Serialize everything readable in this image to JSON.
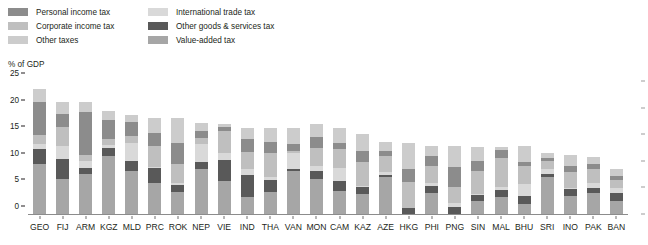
{
  "chart_data": {
    "type": "bar",
    "stacked": true,
    "title": "",
    "subtitle": "",
    "xlabel": "",
    "ylabel": "% of GDP",
    "ylim": [
      0,
      25
    ],
    "yticks": [
      0,
      5,
      10,
      15,
      20,
      25
    ],
    "ytick_labels": [
      "0",
      "5",
      "10",
      "15",
      "20",
      "25"
    ],
    "grid": false,
    "legend_position": "top-left",
    "categories": [
      "GEO",
      "FIJ",
      "ARM",
      "KGZ",
      "MLD",
      "PRC",
      "ROK",
      "NEP",
      "VIE",
      "IND",
      "THA",
      "VAN",
      "MON",
      "CAM",
      "KAZ",
      "AZE",
      "HKG",
      "PHI",
      "PNG",
      "SIN",
      "MAL",
      "BHU",
      "SRI",
      "INO",
      "PAK",
      "BAN"
    ],
    "series": [
      {
        "name": "Value-added tax",
        "color": "#a6a6a6",
        "values": [
          9.6,
          6.8,
          7.8,
          11.0,
          8.3,
          6.1,
          4.3,
          8.6,
          6.4,
          3.3,
          4.3,
          8.2,
          6.7,
          4.6,
          3.9,
          7.1,
          0.0,
          4.1,
          0.0,
          2.7,
          3.3,
          2.1,
          7.2,
          3.6,
          4.2,
          2.6
        ]
      },
      {
        "name": "Other goods & services tax",
        "color": "#595959",
        "values": [
          2.8,
          3.7,
          1.1,
          1.6,
          1.8,
          2.7,
          1.4,
          1.4,
          3.9,
          4.3,
          2.3,
          0.5,
          1.5,
          1.8,
          1.3,
          0.5,
          1.3,
          1.4,
          1.6,
          1.1,
          1.4,
          1.5,
          0.6,
          1.2,
          0.8,
          1.6
        ]
      },
      {
        "name": "International trade tax",
        "color": "#d9d9d9",
        "values": [
          0.9,
          2.4,
          1.2,
          0.6,
          3.4,
          0.3,
          0.4,
          3.3,
          1.3,
          1.0,
          0.5,
          3.0,
          1.1,
          2.5,
          0.3,
          0.4,
          0.0,
          0.5,
          0.6,
          0.2,
          0.6,
          2.2,
          0.9,
          0.3,
          1.0,
          0.9
        ]
      },
      {
        "name": "Corporate income tax",
        "color": "#bfbfbf",
        "values": [
          1.8,
          3.6,
          1.1,
          1.1,
          1.4,
          3.9,
          3.4,
          1.2,
          4.2,
          3.3,
          4.6,
          0.3,
          3.3,
          3.6,
          4.4,
          3.1,
          4.9,
          3.2,
          3.1,
          4.2,
          5.4,
          3.4,
          1.5,
          2.9,
          2.6,
          1.4
        ]
      },
      {
        "name": "Personal income tax",
        "color": "#8c8c8c",
        "values": [
          6.1,
          2.5,
          8.1,
          3.5,
          2.6,
          2.4,
          4.1,
          1.3,
          0.7,
          2.3,
          2.0,
          1.4,
          2.1,
          1.1,
          2.1,
          1.0,
          2.5,
          1.9,
          3.7,
          2.0,
          1.6,
          0.8,
          0.6,
          1.2,
          0.9,
          0.8
        ]
      },
      {
        "name": "Other taxes",
        "color": "#cccccc",
        "values": [
          2.5,
          2.3,
          1.9,
          1.7,
          1.4,
          2.9,
          4.6,
          1.5,
          0.6,
          2.2,
          2.7,
          2.9,
          2.5,
          2.7,
          3.3,
          1.6,
          4.8,
          1.8,
          3.9,
          2.6,
          0.4,
          2.9,
          0.8,
          2.1,
          1.5,
          1.3
        ]
      }
    ],
    "totals": [
      23.7,
      21.3,
      21.2,
      19.5,
      18.9,
      18.3,
      18.2,
      17.3,
      17.1,
      16.4,
      16.4,
      16.3,
      17.2,
      16.3,
      15.3,
      13.7,
      13.5,
      12.9,
      12.9,
      12.8,
      12.7,
      12.9,
      11.6,
      11.3,
      11.0,
      8.6
    ]
  },
  "legend": {
    "columns": [
      {
        "items": [
          {
            "label": "Personal income tax",
            "color": "#8c8c8c",
            "icon": "legend-swatch-icon"
          },
          {
            "label": "Corporate income tax",
            "color": "#bfbfbf",
            "icon": "legend-swatch-icon"
          },
          {
            "label": "Other taxes",
            "color": "#cccccc",
            "icon": "legend-swatch-icon"
          }
        ]
      },
      {
        "items": [
          {
            "label": "International trade tax",
            "color": "#d9d9d9",
            "icon": "legend-swatch-icon"
          },
          {
            "label": "Other goods & services tax",
            "color": "#595959",
            "icon": "legend-swatch-icon"
          },
          {
            "label": "Value-added tax",
            "color": "#a6a6a6",
            "icon": "legend-swatch-icon"
          }
        ]
      }
    ]
  },
  "axis": {
    "y_title": "% of GDP"
  },
  "colors": {
    "text": "#231f20",
    "axis_line": "#8c8c8c",
    "background": "#ffffff"
  }
}
